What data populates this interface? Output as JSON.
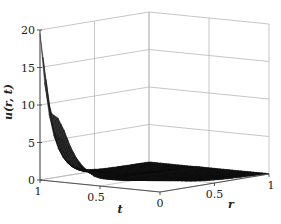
{
  "chart_data": {
    "type": "surface3d",
    "title": "",
    "xlabel": "r",
    "ylabel": "t",
    "zlabel": "u(r, t)",
    "x_ticks": [
      "0",
      "0.5",
      "1"
    ],
    "y_ticks": [
      "1",
      "0.5",
      "0"
    ],
    "z_ticks": [
      "0",
      "5",
      "10",
      "15",
      "20"
    ],
    "xlim": [
      0,
      1
    ],
    "ylim": [
      0,
      1
    ],
    "zlim": [
      0,
      20
    ],
    "grid": true,
    "colormap": "gray",
    "surface_profile_along_t_at_r0": {
      "t": [
        1.0,
        0.98,
        0.95,
        0.92,
        0.9,
        0.85,
        0.8,
        0.75,
        0.7,
        0.65,
        0.6,
        0.55,
        0.5,
        0.4,
        0.3,
        0.2,
        0.1,
        0.05,
        0.0
      ],
      "u": [
        19.5,
        17.0,
        13.5,
        9.5,
        9.0,
        8.5,
        7.0,
        5.0,
        3.5,
        2.5,
        1.8,
        1.2,
        1.0,
        1.0,
        1.1,
        1.3,
        1.6,
        2.0,
        1.8
      ]
    },
    "surface_profile_along_r_at_t0": {
      "r": [
        0.0,
        0.25,
        0.5,
        0.75,
        1.0
      ],
      "u": [
        1.8,
        1.0,
        0.6,
        0.3,
        0.1
      ]
    }
  }
}
